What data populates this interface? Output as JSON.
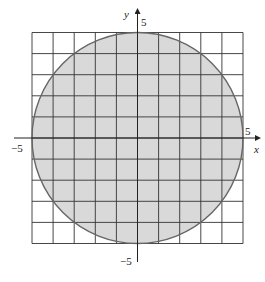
{
  "chart_data": {
    "type": "region",
    "title": "",
    "xlabel": "x",
    "ylabel": "y",
    "xlim": [
      -5,
      5
    ],
    "ylim": [
      -5,
      5
    ],
    "grid": true,
    "grid_step": 1,
    "tick_labels": {
      "x": [
        {
          "value": -5,
          "label": "−5"
        },
        {
          "value": 5,
          "label": "5"
        }
      ],
      "y": [
        {
          "value": 5,
          "label": "5"
        },
        {
          "value": -5,
          "label": "−5"
        }
      ]
    },
    "shapes": [
      {
        "kind": "circle",
        "center": [
          0,
          0
        ],
        "radius": 5,
        "fill": "#d9d9d9",
        "stroke": "#666666"
      }
    ]
  },
  "labels": {
    "x_axis": "x",
    "y_axis": "y",
    "x_neg": "−5",
    "x_pos": "5",
    "y_pos": "5",
    "y_neg": "−5"
  },
  "colors": {
    "fill": "#d9d9d9",
    "grid": "#333333",
    "circle_stroke": "#666666",
    "axis": "#222222"
  }
}
